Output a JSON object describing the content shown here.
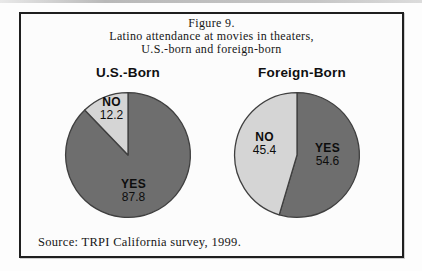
{
  "figure": {
    "title_line1": "Figure 9.",
    "title_line2": "Latino attendance at movies in theaters,",
    "title_line3": "U.S.-born and foreign-born",
    "source": "Source: TRPI California survey, 1999."
  },
  "colors": {
    "yes_slice": "#6e6e6e",
    "no_slice": "#d5d5d5",
    "pie_outline": "#3f3f3f",
    "frame_border": "#1f1f1f"
  },
  "chart_data": [
    {
      "type": "pie",
      "title": "U.S.-Born",
      "labels": [
        "YES",
        "NO"
      ],
      "values": [
        87.8,
        12.2
      ],
      "slice_colors": [
        "#6e6e6e",
        "#d5d5d5"
      ],
      "start_angle_deg": 0,
      "direction": "clockwise",
      "legend_position": "labels-inside"
    },
    {
      "type": "pie",
      "title": "Foreign-Born",
      "labels": [
        "YES",
        "NO"
      ],
      "values": [
        54.6,
        45.4
      ],
      "slice_colors": [
        "#6e6e6e",
        "#d5d5d5"
      ],
      "start_angle_deg": 0,
      "direction": "clockwise",
      "legend_position": "labels-inside"
    }
  ]
}
